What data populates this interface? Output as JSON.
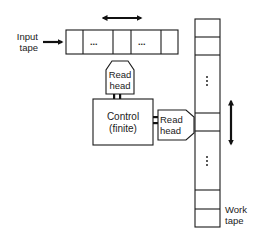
{
  "diagram": {
    "input_tape": {
      "label_line1": "Input",
      "label_line2": "tape",
      "cells": [
        "",
        "...",
        "",
        "...",
        ""
      ]
    },
    "work_tape": {
      "label_line1": "Work",
      "label_line2": "tape",
      "cells": [
        "",
        "",
        "⋮",
        "",
        "",
        "⋮",
        "",
        ""
      ]
    },
    "control": {
      "line1": "Control",
      "line2": "(finite)"
    },
    "read_head_top": {
      "line1": "Read",
      "line2": "head"
    },
    "read_head_right": {
      "line1": "Read",
      "line2": "head"
    },
    "arrows": {
      "input_feed": "right-arrow",
      "input_tape_motion": "left-right-double-arrow",
      "work_tape_motion": "up-down-double-arrow"
    },
    "colors": {
      "line": "#1a1a1a",
      "background": "#ffffff"
    }
  }
}
